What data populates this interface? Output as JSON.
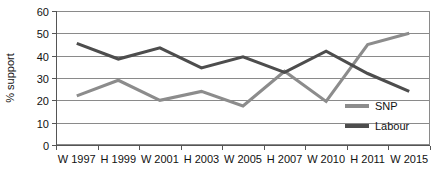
{
  "chart_data": {
    "type": "line",
    "title": "",
    "xlabel": "",
    "ylabel": "% support",
    "categories": [
      "W 1997",
      "H 1999",
      "W 2001",
      "H 2003",
      "W 2005",
      "H 2007",
      "W 2010",
      "H 2011",
      "W 2015"
    ],
    "ylim": [
      0,
      60
    ],
    "ytick_step": 10,
    "yticks": [
      "0",
      "10",
      "20",
      "30",
      "40",
      "50",
      "60"
    ],
    "grid": true,
    "legend_position": "inside-bottom-right",
    "series": [
      {
        "name": "SNP",
        "color": "#8c8c8c",
        "values": [
          22,
          29,
          20,
          24,
          17.5,
          33,
          19.5,
          45,
          50
        ]
      },
      {
        "name": "Labour",
        "color": "#4d4d4d",
        "values": [
          45.5,
          38.5,
          43.5,
          34.5,
          39.5,
          32.5,
          42,
          32,
          24
        ]
      }
    ]
  },
  "colors": {
    "snp": "#8c8c8c",
    "labour": "#4d4d4d",
    "gridline": "#8a8a8a",
    "axis": "#555555",
    "text": "#111111",
    "background": "#ffffff"
  }
}
